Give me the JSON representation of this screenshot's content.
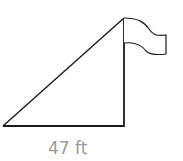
{
  "figure": {
    "type": "right-triangle-with-flagpole",
    "base_label": "47 ft",
    "stroke_color": "#1a1a1a",
    "label_color": "#9a9a9a",
    "vertices": {
      "bottom_left": [
        3,
        126
      ],
      "right_angle": [
        124,
        126
      ],
      "top": [
        124,
        18
      ]
    },
    "flag": {
      "attached_to": "top"
    }
  }
}
